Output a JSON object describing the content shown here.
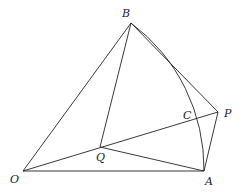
{
  "diagram": {
    "type": "geometry",
    "points": {
      "O": {
        "label": "O",
        "x": 23,
        "y": 171
      },
      "A": {
        "label": "A",
        "x": 204,
        "y": 171
      },
      "B": {
        "label": "B",
        "x": 131,
        "y": 23
      },
      "P": {
        "label": "P",
        "x": 218,
        "y": 112
      },
      "Q": {
        "label": "Q",
        "x": 100,
        "y": 147
      },
      "C": {
        "label": "C",
        "x": 195,
        "y": 119
      }
    },
    "segments": [
      "OA",
      "OB",
      "BQ",
      "QA",
      "OP",
      "BP",
      "PA"
    ],
    "arcs": [
      {
        "from": "B",
        "to": "A",
        "center": "O"
      }
    ],
    "stroke_color": "#222222"
  }
}
